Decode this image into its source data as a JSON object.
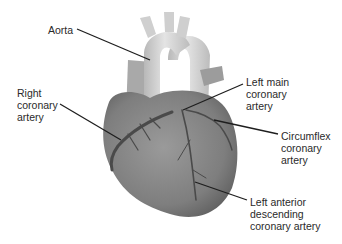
{
  "diagram": {
    "labels": [
      {
        "id": "aorta",
        "text": "Aorta",
        "x": 48,
        "y": 24
      },
      {
        "id": "right-coronary-artery",
        "text": "Right\ncoronary\nartery",
        "x": 17,
        "y": 87
      },
      {
        "id": "left-main-coronary-artery",
        "text": "Left main\ncoronary\nartery",
        "x": 246,
        "y": 76
      },
      {
        "id": "circumflex-coronary-artery",
        "text": "Circumflex\ncoronary\nartery",
        "x": 281,
        "y": 130
      },
      {
        "id": "left-anterior-descending-coronary-artery",
        "text": "Left anterior\ndescending\ncoronary artery",
        "x": 250,
        "y": 196
      }
    ],
    "leaders": [
      {
        "id": "aorta",
        "x1": 77,
        "y1": 29,
        "x2": 150,
        "y2": 60
      },
      {
        "id": "right-coronary-artery",
        "x1": 60,
        "y1": 104,
        "x2": 121,
        "y2": 140
      },
      {
        "id": "left-main-coronary-artery",
        "x1": 243,
        "y1": 84,
        "x2": 183,
        "y2": 110
      },
      {
        "id": "circumflex-coronary-artery",
        "x1": 278,
        "y1": 134,
        "x2": 214,
        "y2": 120
      },
      {
        "id": "left-anterior-descending-coronary-artery",
        "x1": 247,
        "y1": 200,
        "x2": 195,
        "y2": 182
      }
    ],
    "colors": {
      "heart_fill": "#8a8a8a",
      "heart_shade": "#6e6e6e",
      "vessel_fill": "#d2d2d2",
      "artery_stroke": "#4a4a4a",
      "leader_stroke": "#1e1e1e",
      "text": "#2a2a2a"
    }
  }
}
